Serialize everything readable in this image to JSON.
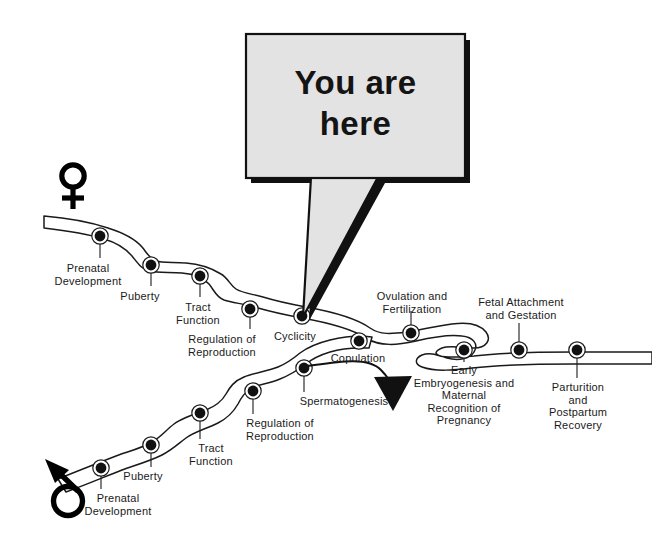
{
  "figure": {
    "background_color": "#ffffff",
    "ink_color": "#1a1a1a",
    "bubble_fill_color": "#e3e3e3",
    "bubble_shadow_color": "#111111"
  },
  "callout": {
    "text": "You are\nhere",
    "line1": "You are",
    "line2": "here",
    "points_to": "Cyclicity"
  },
  "symbols": {
    "female": {
      "glyph": "♀",
      "name": "female-symbol",
      "meaning": "female reproductive track start"
    },
    "male": {
      "glyph": "♂",
      "name": "male-symbol",
      "meaning": "male reproductive track start"
    }
  },
  "tracks": [
    {
      "id": "female-track",
      "symbol": "♀",
      "stations": [
        {
          "id": "f1",
          "label": "Prenatal\nDevelopment",
          "x": 100,
          "y": 236,
          "label_x": 88,
          "label_y": 262
        },
        {
          "id": "f2",
          "label": "Puberty",
          "x": 151,
          "y": 265,
          "label_x": 140,
          "label_y": 290
        },
        {
          "id": "f3",
          "label": "Tract\nFunction",
          "x": 200,
          "y": 276,
          "label_x": 198,
          "label_y": 301
        },
        {
          "id": "f4",
          "label": "Regulation of\nReproduction",
          "x": 250,
          "y": 309,
          "label_x": 222,
          "label_y": 333
        },
        {
          "id": "f5",
          "label": "Cyclicity",
          "x": 302,
          "y": 316,
          "label_x": 295,
          "label_y": 330
        },
        {
          "id": "f6",
          "label": "Ovulation and\nFertilization",
          "x": 411,
          "y": 333,
          "label_x": 412,
          "label_y": 292
        },
        {
          "id": "f7",
          "label": "Early\nEmbryogenesis and\nMaternal\nRecognition of\nPregnancy",
          "x": 464,
          "y": 350,
          "label_x": 464,
          "label_y": 364
        },
        {
          "id": "f8",
          "label": "Fetal Attachment\nand Gestation",
          "x": 519,
          "y": 350,
          "label_x": 521,
          "label_y": 297
        },
        {
          "id": "f9",
          "label": "Parturition and\nPostpartum\nRecovery",
          "x": 577,
          "y": 350,
          "label_x": 578,
          "label_y": 381
        }
      ]
    },
    {
      "id": "male-track",
      "symbol": "♂",
      "stations": [
        {
          "id": "m1",
          "label": "Prenatal\nDevelopment",
          "x": 101,
          "y": 468,
          "label_x": 118,
          "label_y": 493
        },
        {
          "id": "m2",
          "label": "Puberty",
          "x": 151,
          "y": 445,
          "label_x": 143,
          "label_y": 471
        },
        {
          "id": "m3",
          "label": "Tract\nFunction",
          "x": 200,
          "y": 413,
          "label_x": 211,
          "label_y": 443
        },
        {
          "id": "m4",
          "label": "Regulation of\nReproduction",
          "x": 253,
          "y": 391,
          "label_x": 280,
          "label_y": 418
        },
        {
          "id": "m5",
          "label": "Spermatogenesis",
          "x": 304,
          "y": 368,
          "label_x": 344,
          "label_y": 396
        },
        {
          "id": "m6",
          "label": "Copulation",
          "x": 359,
          "y": 341,
          "label_x": 358,
          "label_y": 353
        }
      ]
    }
  ],
  "flow_arrow": {
    "name": "copulation-to-pregnancy-arrow",
    "from": "Copulation",
    "to": "Early Embryogenesis"
  },
  "legend_note": ""
}
